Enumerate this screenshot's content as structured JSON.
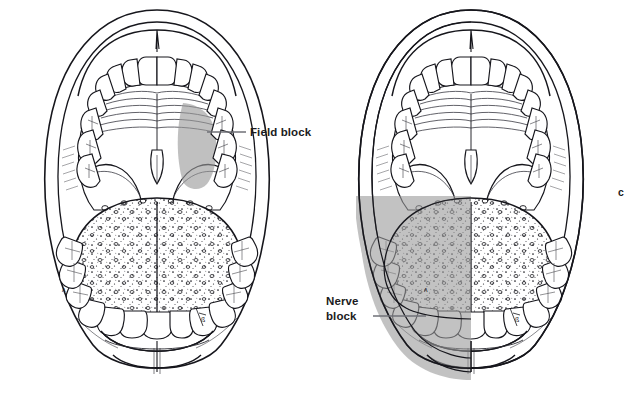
{
  "figure": {
    "letter": "c",
    "panels": [
      {
        "id": "left-panel",
        "name": "field-block-diagram",
        "label": "Field block",
        "label_lines": [
          "Field block"
        ],
        "shaded_region": "upper-left-molars-buccal-gingiva",
        "shade_color": "#9a9a9a",
        "shade_opacity": 0.62
      },
      {
        "id": "right-panel",
        "name": "nerve-block-diagram",
        "label": "Nerve block",
        "label_lines": [
          "Nerve",
          "block"
        ],
        "shaded_region": "entire-left-hemimandible-and-left-tongue",
        "shade_color": "#9a9a9a",
        "shade_opacity": 0.62
      }
    ]
  },
  "labels": {
    "field_block": "Field block",
    "nerve_block_line1": "Nerve",
    "nerve_block_line2": "block",
    "figure_letter": "c"
  },
  "colors": {
    "ink": "#16161c",
    "shade": "#9a9a9a",
    "leader": "#6f7177",
    "background": "#ffffff",
    "tongue_fill": "#ffffff",
    "tongue_shaded": "#8f8f8f"
  },
  "anatomy": {
    "parts": [
      "upper lip",
      "hard palate with rugae",
      "uvula",
      "soft palate",
      "palatoglossal arch",
      "maxillary incisors",
      "maxillary canines",
      "maxillary premolars",
      "maxillary molars",
      "tongue dorsum with papillae",
      "mandibular incisors",
      "mandibular canines",
      "mandibular premolars",
      "mandibular molars",
      "lower lip",
      "chin"
    ]
  }
}
